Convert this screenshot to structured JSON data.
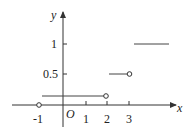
{
  "diagram": {
    "type": "step-function-graph",
    "axes": {
      "x_label": "x",
      "y_label": "y",
      "origin_label": "O",
      "x_ticks": [
        "-1",
        "1",
        "2",
        "3"
      ],
      "y_ticks": [
        "0.5",
        "1"
      ]
    },
    "segments": [
      {
        "from_x": -1,
        "to_x": 2,
        "y": 0.15,
        "right_endpoint": "open"
      },
      {
        "from_x": 2,
        "to_x": 3,
        "y": 0.5,
        "right_endpoint": "open"
      },
      {
        "from_x": 3,
        "to_x": 4,
        "y": 1,
        "right_endpoint": "none"
      }
    ],
    "points": [
      {
        "x": -1,
        "y": 0,
        "style": "open"
      }
    ],
    "colors": {
      "stroke": "#333333",
      "background": "#ffffff"
    }
  }
}
